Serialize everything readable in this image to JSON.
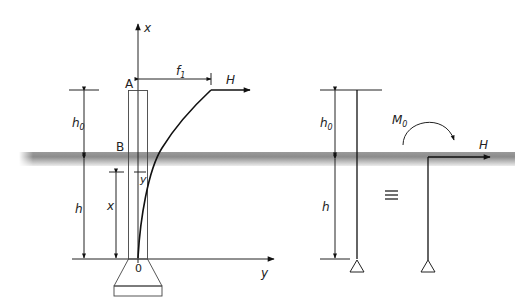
{
  "diagram": {
    "left_figure": {
      "axis_x_label": "x",
      "axis_y_label": "y",
      "origin_label": "0",
      "point_top_label": "A",
      "point_ground_label": "B",
      "offset_label": "f",
      "offset_sub": "1",
      "force_label": "H",
      "dim_free_length_label": "h",
      "dim_free_length_sub": "0",
      "dim_embedded_label": "h",
      "dim_depth_label": "x",
      "deflection_label": "y"
    },
    "equivalence_symbol": "≡",
    "middle_figure": {
      "dim_free_length_label": "h",
      "dim_free_length_sub": "0",
      "dim_embedded_label": "h",
      "support": "pin-triangle"
    },
    "right_figure": {
      "moment_label": "M",
      "moment_sub": "0",
      "force_label": "H",
      "support": "pin-triangle"
    },
    "colors": {
      "line": "#222222",
      "ground_dark": "#8a8a8a",
      "ground_light": "#e6e6e6",
      "background": "#ffffff"
    }
  }
}
